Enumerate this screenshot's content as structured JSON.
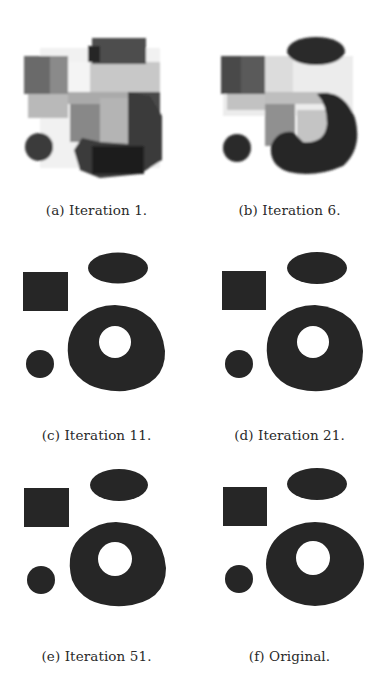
{
  "figure": {
    "panels": [
      {
        "id": "a",
        "caption": "(a) Iteration 1.",
        "iteration": 1
      },
      {
        "id": "b",
        "caption": "(b) Iteration 6.",
        "iteration": 6
      },
      {
        "id": "c",
        "caption": "(c) Iteration 11.",
        "iteration": 11
      },
      {
        "id": "d",
        "caption": "(d) Iteration 21.",
        "iteration": 21
      },
      {
        "id": "e",
        "caption": "(e) Iteration 51.",
        "iteration": 51
      },
      {
        "id": "f",
        "caption": "(f) Original.",
        "iteration": null
      }
    ],
    "colors": {
      "shape_dark": "#262626",
      "background": "#ffffff",
      "noise": "#f2f2f2"
    }
  }
}
